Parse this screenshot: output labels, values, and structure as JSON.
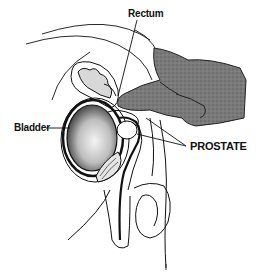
{
  "diagram": {
    "labels": {
      "rectum": "Rectum",
      "bladder": "Bladder",
      "prostate": "PROSTATE"
    },
    "colors": {
      "background": "#ffffff",
      "ink": "#111111",
      "hand_fill": "#6e6e6e",
      "bladder_fill": "#9a9a9a"
    }
  }
}
